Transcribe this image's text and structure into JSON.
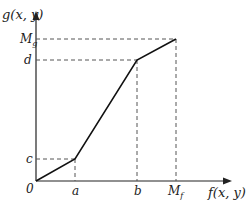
{
  "diagram": {
    "type": "piecewise-linear-mapping",
    "axes": {
      "x_label": "f(x, y)",
      "y_label": "g(x, y)",
      "origin_label": "0"
    },
    "x_ticks": [
      "a",
      "b",
      "M_f"
    ],
    "y_ticks": [
      "c",
      "d",
      "M_g"
    ],
    "tick_labels": {
      "a": "a",
      "b": "b",
      "Mf_main": "M",
      "Mf_sub": "f",
      "c": "c",
      "d": "d",
      "Mg_main": "M",
      "Mg_sub": "g"
    },
    "points": [
      {
        "x": "0",
        "y": "0"
      },
      {
        "x": "a",
        "y": "c"
      },
      {
        "x": "b",
        "y": "d"
      },
      {
        "x": "M_f",
        "y": "M_g"
      }
    ],
    "colors": {
      "line": "#111111",
      "axis": "#222222",
      "dash": "#555555"
    }
  }
}
